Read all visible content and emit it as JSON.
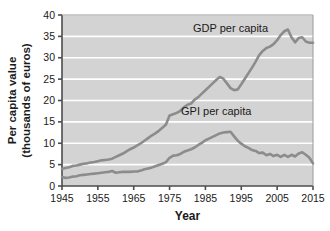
{
  "chart_data": {
    "type": "line",
    "title": "",
    "xlabel": "Year",
    "ylabel_line1": "Per capita value",
    "ylabel_line2": "(thousands of euros)",
    "xlim": [
      1945,
      2015
    ],
    "ylim": [
      0,
      40
    ],
    "xticks": [
      1945,
      1955,
      1965,
      1975,
      1985,
      1995,
      2005,
      2015
    ],
    "yticks": [
      0,
      5,
      10,
      15,
      20,
      25,
      30,
      35,
      40
    ],
    "grid": "horizontal",
    "legend_position": "inline-annotations",
    "plot_background": "#d3d3d3",
    "gridline_color": "#ffffff",
    "line_color": "#8c8c8c",
    "axis_color": "#4d4d4d",
    "text_color": "#1a1a1a",
    "series": [
      {
        "name": "GDP per capita",
        "label": "GDP per capita",
        "x": [
          1945,
          1946,
          1947,
          1948,
          1949,
          1950,
          1951,
          1952,
          1953,
          1954,
          1955,
          1956,
          1957,
          1958,
          1959,
          1960,
          1961,
          1962,
          1963,
          1964,
          1965,
          1966,
          1967,
          1968,
          1969,
          1970,
          1971,
          1972,
          1973,
          1974,
          1975,
          1976,
          1977,
          1978,
          1979,
          1980,
          1981,
          1982,
          1983,
          1984,
          1985,
          1986,
          1987,
          1988,
          1989,
          1990,
          1991,
          1992,
          1993,
          1994,
          1995,
          1996,
          1997,
          1998,
          1999,
          2000,
          2001,
          2002,
          2003,
          2004,
          2005,
          2006,
          2007,
          2008,
          2009,
          2010,
          2011,
          2012,
          2013,
          2014,
          2015
        ],
        "y": [
          4.0,
          4.2,
          4.4,
          4.7,
          4.8,
          5.0,
          5.2,
          5.3,
          5.5,
          5.6,
          5.8,
          6.0,
          6.1,
          6.2,
          6.4,
          6.8,
          7.2,
          7.6,
          8.1,
          8.6,
          9.0,
          9.5,
          10.0,
          10.6,
          11.2,
          11.8,
          12.3,
          12.9,
          13.6,
          14.4,
          16.5,
          16.8,
          17.1,
          17.6,
          18.4,
          19.0,
          19.3,
          20.2,
          20.8,
          21.6,
          22.4,
          23.2,
          24.0,
          24.8,
          25.5,
          25.1,
          24.0,
          22.9,
          22.4,
          22.6,
          23.8,
          25.1,
          26.4,
          27.7,
          29.1,
          30.6,
          31.6,
          32.3,
          32.6,
          33.2,
          34.1,
          35.3,
          36.2,
          36.6,
          34.8,
          33.6,
          34.6,
          34.8,
          33.8,
          33.5,
          33.5
        ],
        "annotation_x": 1992,
        "annotation_y": 36.0
      },
      {
        "name": "GPI per capita",
        "label": "GPI per capita",
        "x": [
          1945,
          1946,
          1947,
          1948,
          1949,
          1950,
          1951,
          1952,
          1953,
          1954,
          1955,
          1956,
          1957,
          1958,
          1959,
          1960,
          1961,
          1962,
          1963,
          1964,
          1965,
          1966,
          1967,
          1968,
          1969,
          1970,
          1971,
          1972,
          1973,
          1974,
          1975,
          1976,
          1977,
          1978,
          1979,
          1980,
          1981,
          1982,
          1983,
          1984,
          1985,
          1986,
          1987,
          1988,
          1989,
          1990,
          1991,
          1992,
          1993,
          1994,
          1995,
          1996,
          1997,
          1998,
          1999,
          2000,
          2001,
          2002,
          2003,
          2004,
          2005,
          2006,
          2007,
          2008,
          2009,
          2010,
          2011,
          2012,
          2013,
          2014,
          2015
        ],
        "y": [
          2.1,
          1.9,
          2.0,
          2.2,
          2.3,
          2.5,
          2.6,
          2.7,
          2.8,
          2.9,
          3.0,
          3.1,
          3.2,
          3.3,
          3.5,
          3.1,
          3.2,
          3.3,
          3.3,
          3.3,
          3.4,
          3.4,
          3.6,
          3.9,
          4.1,
          4.3,
          4.6,
          4.9,
          5.2,
          5.6,
          6.6,
          7.1,
          7.2,
          7.5,
          8.0,
          8.3,
          8.6,
          9.0,
          9.6,
          10.1,
          10.7,
          11.1,
          11.5,
          11.9,
          12.3,
          12.5,
          12.6,
          12.7,
          11.6,
          10.6,
          9.9,
          9.3,
          8.9,
          8.4,
          8.2,
          7.7,
          7.8,
          7.2,
          7.5,
          7.0,
          7.3,
          6.8,
          7.3,
          6.8,
          7.3,
          6.9,
          7.6,
          7.9,
          7.3,
          6.6,
          5.3
        ],
        "annotation_x": 1988,
        "annotation_y": 16.6
      }
    ]
  }
}
